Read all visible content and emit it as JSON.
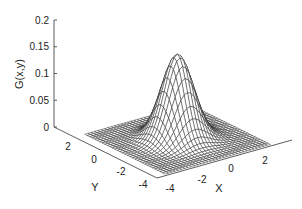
{
  "chart_data": {
    "type": "surface",
    "title": "",
    "function": "G(x,y) = exp(-(x^2+y^2)/2) / (2*pi)",
    "xlabel": "X",
    "ylabel": "Y",
    "zlabel": "G(x,y)",
    "x_range": [
      -4,
      4
    ],
    "y_range": [
      -4,
      4
    ],
    "zlim": [
      0,
      0.2
    ],
    "grid_step": 0.25,
    "peak": {
      "x": 0,
      "y": 0,
      "z": 0.159
    },
    "x_ticks": [
      "-4",
      "-2",
      "0",
      "2"
    ],
    "y_ticks": [
      "-4",
      "-2",
      "0",
      "2"
    ],
    "z_ticks": [
      "0",
      "0.05",
      "0.1",
      "0.15",
      "0.2"
    ],
    "grid": false,
    "legend": null,
    "mesh_color": "#1a1a1a"
  }
}
